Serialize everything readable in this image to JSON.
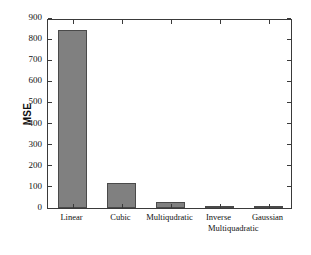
{
  "chart_data": {
    "type": "bar",
    "title": "",
    "xlabel": "",
    "ylabel": "MSE",
    "ylim": [
      0,
      900
    ],
    "yticks": [
      0,
      100,
      200,
      300,
      400,
      500,
      600,
      700,
      800,
      900
    ],
    "ytick_labels": [
      "0",
      "100",
      "200",
      "300",
      "400",
      "500",
      "600",
      "700",
      "800",
      "900"
    ],
    "grid": false,
    "legend": null,
    "categories": [
      "Linear",
      "Cubic",
      "Multiqudratic",
      "Inverse Multiquadratic",
      "Gaussian"
    ],
    "category_lines": [
      [
        "Linear"
      ],
      [
        "Cubic"
      ],
      [
        "Multiqudratic"
      ],
      [
        "Inverse",
        "Multiquadratic"
      ],
      [
        "Gaussian"
      ]
    ],
    "values": [
      843,
      120,
      27,
      11,
      7
    ],
    "bar_color": "#808080",
    "bar_edge_color": "#4a4a4a",
    "axis_color": "#3a3a3a",
    "background": "#ffffff"
  }
}
